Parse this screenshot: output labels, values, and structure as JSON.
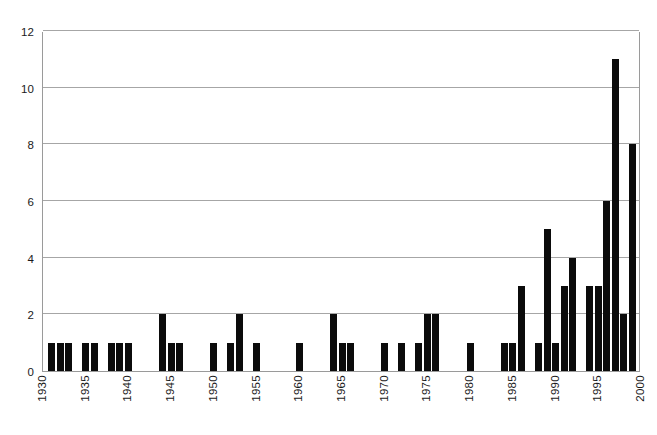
{
  "chart_data": {
    "type": "bar",
    "title": "",
    "subtitle": "",
    "xlabel": "",
    "ylabel": "",
    "xlim": [
      1930,
      2000
    ],
    "ylim": [
      0,
      12
    ],
    "grid": true,
    "gridlines_y": [
      0,
      2,
      4,
      6,
      8,
      10,
      12
    ],
    "legend": null,
    "legend_position": "none",
    "annotations": [],
    "bar_color": "#0b0b0b",
    "gridline_color": "#a6a6a6",
    "axis_color": "#9a9a9a",
    "ytick_labels": [
      "12",
      "10",
      "8",
      "6",
      "4",
      "2",
      "0"
    ],
    "ytick_values": [
      12,
      10,
      8,
      6,
      4,
      2,
      0
    ],
    "xtick_labels": [
      "1930",
      "1935",
      "1940",
      "1945",
      "1950",
      "1955",
      "1960",
      "1965",
      "1970",
      "1975",
      "1980",
      "1985",
      "1990",
      "1995",
      "2000"
    ],
    "xtick_values": [
      1930,
      1935,
      1940,
      1945,
      1950,
      1955,
      1960,
      1965,
      1970,
      1975,
      1980,
      1985,
      1990,
      1995,
      2000
    ],
    "x": [
      1931,
      1932,
      1933,
      1935,
      1936,
      1938,
      1939,
      1940,
      1944,
      1945,
      1946,
      1950,
      1952,
      1953,
      1955,
      1960,
      1964,
      1965,
      1966,
      1970,
      1972,
      1974,
      1975,
      1976,
      1980,
      1984,
      1985,
      1986,
      1988,
      1989,
      1990,
      1991,
      1992,
      1994,
      1995,
      1996,
      1997,
      1998,
      1999
    ],
    "values": [
      1,
      1,
      1,
      1,
      1,
      1,
      1,
      1,
      2,
      1,
      1,
      1,
      1,
      2,
      1,
      1,
      2,
      1,
      1,
      1,
      1,
      1,
      2,
      2,
      1,
      1,
      1,
      3,
      1,
      5,
      1,
      3,
      4,
      3,
      3,
      6,
      11,
      2,
      8
    ],
    "categories": [
      "1931",
      "1932",
      "1933",
      "1935",
      "1936",
      "1938",
      "1939",
      "1940",
      "1944",
      "1945",
      "1946",
      "1950",
      "1952",
      "1953",
      "1955",
      "1960",
      "1964",
      "1965",
      "1966",
      "1970",
      "1972",
      "1974",
      "1975",
      "1976",
      "1980",
      "1984",
      "1985",
      "1986",
      "1988",
      "1989",
      "1990",
      "1991",
      "1992",
      "1994",
      "1995",
      "1996",
      "1997",
      "1998",
      "1999"
    ]
  }
}
